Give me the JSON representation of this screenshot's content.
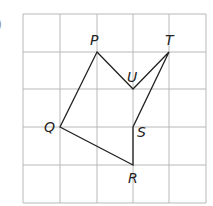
{
  "diagram": {
    "type": "grid-polygon",
    "grid": {
      "columns": 5,
      "rows": 5,
      "x_lines": [
        23,
        60,
        97,
        133,
        169,
        206
      ],
      "y_lines": [
        14,
        52,
        89,
        127,
        165,
        203
      ],
      "line_color": "#b8b8b8"
    },
    "stroke_color": "#222222",
    "cut_mark": ")",
    "points": {
      "P": {
        "label": "P",
        "x": 97,
        "y": 52
      },
      "T": {
        "label": "T",
        "x": 169,
        "y": 52
      },
      "U": {
        "label": "U",
        "x": 133,
        "y": 89
      },
      "Q": {
        "label": "Q",
        "x": 60,
        "y": 127
      },
      "S": {
        "label": "S",
        "x": 133,
        "y": 127
      },
      "R": {
        "label": "R",
        "x": 133,
        "y": 165
      }
    },
    "polygon_order": [
      "P",
      "U",
      "T",
      "S",
      "R",
      "Q"
    ]
  }
}
